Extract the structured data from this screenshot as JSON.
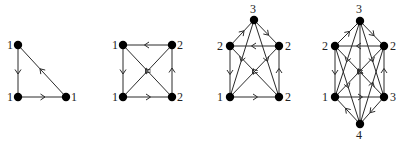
{
  "figure": {
    "colors": {
      "edge": "#2a2a2a",
      "node": "#000000",
      "label": "#222222",
      "background": "#ffffff"
    },
    "graphs": [
      {
        "id": "graph-1",
        "nodes": [
          {
            "id": "a",
            "x": 18,
            "y": 45,
            "label": "1",
            "lx": 7,
            "ly": 49
          },
          {
            "id": "b",
            "x": 18,
            "y": 97,
            "label": "1",
            "lx": 7,
            "ly": 101
          },
          {
            "id": "c",
            "x": 66,
            "y": 97,
            "label": "1",
            "lx": 71,
            "ly": 101
          }
        ],
        "edges": [
          {
            "from": "a",
            "to": "b",
            "arrow": true
          },
          {
            "from": "b",
            "to": "c",
            "arrow": true
          },
          {
            "from": "c",
            "to": "a",
            "arrow": true
          }
        ]
      },
      {
        "id": "graph-2",
        "nodes": [
          {
            "id": "tl",
            "x": 123,
            "y": 45,
            "label": "1",
            "lx": 112,
            "ly": 49
          },
          {
            "id": "tr",
            "x": 172,
            "y": 45,
            "label": "2",
            "lx": 177,
            "ly": 49
          },
          {
            "id": "bl",
            "x": 123,
            "y": 97,
            "label": "1",
            "lx": 112,
            "ly": 101
          },
          {
            "id": "br",
            "x": 172,
            "y": 97,
            "label": "2",
            "lx": 177,
            "ly": 101
          }
        ],
        "edges": [
          {
            "from": "tr",
            "to": "tl",
            "arrow": true
          },
          {
            "from": "tl",
            "to": "bl",
            "arrow": true
          },
          {
            "from": "bl",
            "to": "br",
            "arrow": true
          },
          {
            "from": "br",
            "to": "tr",
            "arrow": true
          },
          {
            "from": "br",
            "to": "tl",
            "arrow": true
          },
          {
            "from": "tr",
            "to": "bl",
            "arrow": true
          }
        ]
      },
      {
        "id": "graph-3",
        "nodes": [
          {
            "id": "t",
            "x": 254,
            "y": 20,
            "label": "3",
            "lx": 250,
            "ly": 13
          },
          {
            "id": "ml",
            "x": 230,
            "y": 46,
            "label": "2",
            "lx": 217,
            "ly": 50
          },
          {
            "id": "mr",
            "x": 279,
            "y": 46,
            "label": "2",
            "lx": 285,
            "ly": 50
          },
          {
            "id": "bl",
            "x": 230,
            "y": 97,
            "label": "1",
            "lx": 217,
            "ly": 101
          },
          {
            "id": "br",
            "x": 279,
            "y": 97,
            "label": "2",
            "lx": 285,
            "ly": 101
          }
        ],
        "edges": [
          {
            "from": "ml",
            "to": "t",
            "arrow": true
          },
          {
            "from": "t",
            "to": "mr",
            "arrow": true
          },
          {
            "from": "mr",
            "to": "ml",
            "arrow": true
          },
          {
            "from": "ml",
            "to": "bl",
            "arrow": true
          },
          {
            "from": "bl",
            "to": "br",
            "arrow": true
          },
          {
            "from": "br",
            "to": "mr",
            "arrow": true
          },
          {
            "from": "t",
            "to": "bl",
            "arrow": true
          },
          {
            "from": "t",
            "to": "br",
            "arrow": true
          },
          {
            "from": "mr",
            "to": "bl",
            "arrow": true
          },
          {
            "from": "br",
            "to": "ml",
            "arrow": true
          }
        ]
      },
      {
        "id": "graph-4",
        "nodes": [
          {
            "id": "t",
            "x": 360,
            "y": 21,
            "label": "3",
            "lx": 356,
            "ly": 13
          },
          {
            "id": "ml",
            "x": 335,
            "y": 46,
            "label": "2",
            "lx": 322,
            "ly": 50
          },
          {
            "id": "mr",
            "x": 384,
            "y": 46,
            "label": "2",
            "lx": 390,
            "ly": 50
          },
          {
            "id": "bl",
            "x": 335,
            "y": 97,
            "label": "1",
            "lx": 322,
            "ly": 101
          },
          {
            "id": "br",
            "x": 384,
            "y": 97,
            "label": "3",
            "lx": 390,
            "ly": 101
          },
          {
            "id": "b",
            "x": 360,
            "y": 124,
            "label": "4",
            "lx": 356,
            "ly": 139
          }
        ],
        "edges": [
          {
            "from": "ml",
            "to": "t",
            "arrow": true
          },
          {
            "from": "t",
            "to": "mr",
            "arrow": true
          },
          {
            "from": "mr",
            "to": "ml",
            "arrow": true
          },
          {
            "from": "ml",
            "to": "bl",
            "arrow": true
          },
          {
            "from": "bl",
            "to": "br",
            "arrow": true
          },
          {
            "from": "br",
            "to": "mr",
            "arrow": true
          },
          {
            "from": "b",
            "to": "bl",
            "arrow": true
          },
          {
            "from": "br",
            "to": "b",
            "arrow": true
          },
          {
            "from": "t",
            "to": "bl",
            "arrow": true
          },
          {
            "from": "t",
            "to": "br",
            "arrow": true
          },
          {
            "from": "b",
            "to": "t",
            "arrow": true
          },
          {
            "from": "mr",
            "to": "bl",
            "arrow": true
          },
          {
            "from": "br",
            "to": "ml",
            "arrow": true
          },
          {
            "from": "ml",
            "to": "b",
            "arrow": true
          },
          {
            "from": "b",
            "to": "mr",
            "arrow": true
          }
        ]
      }
    ]
  }
}
